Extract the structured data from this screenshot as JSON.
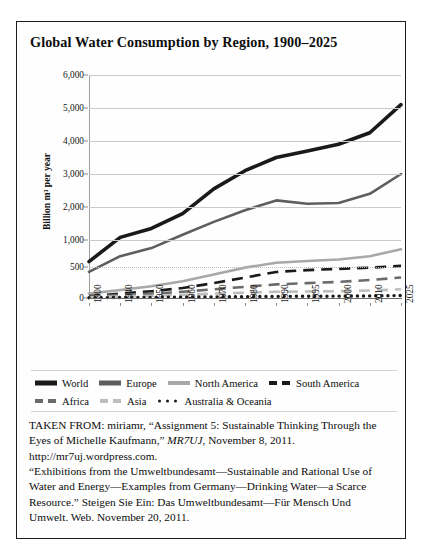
{
  "figure": {
    "title": "Global Water Consumption by Region, 1900–2025"
  },
  "caption": {
    "line1_a": "TAKEN FROM: miriamr, “Assignment 5: Sustainable Thinking Through the Eyes of Michelle Kaufmann,” ",
    "line1_italic": "MR7UJ",
    "line1_b": ", November 8, 2011. http://mr7uj.wordpress.com.",
    "line2": "“Exhibitions from the Umweltbundesamt—Sustainable and Rational Use of Water and Energy—Examples from Germany—Drinking Water—a Scarce Resource.” Steigen Sie Ein: Das Umweltbundesamt—Für Mensch Und Umwelt. Web. November 20, 2011."
  },
  "colors": {
    "world": "#1a1a1a",
    "europe": "#5e5e5e",
    "north_america": "#a8a8a8",
    "south_america": "#1a1a1a",
    "africa": "#6b6b6b",
    "asia": "#bdbdbd",
    "australia_oceania": "#1a1a1a",
    "gridline": "#c9c9c9",
    "frame": "#1b1b1b"
  },
  "chart_data": {
    "type": "line",
    "title": "Global Water Consumption by Region, 1900–2025",
    "xlabel": "",
    "ylabel": "Billion m³ per year",
    "grid": true,
    "legend_position": "bottom",
    "categories": [
      "1900",
      "1940",
      "1950",
      "1960",
      "1970",
      "1980",
      "1990",
      "1995",
      "2000",
      "2010",
      "2025"
    ],
    "ytick_labels": [
      "6,000",
      "5,000",
      "4,000",
      "3,000",
      "2,000",
      "1,000",
      "500",
      "0"
    ],
    "ytick_values": [
      6000,
      5000,
      4000,
      3000,
      2000,
      1000,
      500,
      0
    ],
    "ylim": [
      0,
      6000
    ],
    "series": [
      {
        "name": "World",
        "style": "solid",
        "width": "thick",
        "color": "#1a1a1a",
        "values": [
          600,
          1080,
          1350,
          1800,
          2550,
          3100,
          3500,
          3700,
          3900,
          4250,
          5100
        ]
      },
      {
        "name": "Europe",
        "style": "solid",
        "width": "medium",
        "color": "#5e5e5e",
        "values": [
          420,
          700,
          850,
          1160,
          1550,
          1900,
          2200,
          2100,
          2120,
          2400,
          3000
        ]
      },
      {
        "name": "North America",
        "style": "solid",
        "width": "medium",
        "color": "#a8a8a8",
        "values": [
          70,
          130,
          190,
          270,
          380,
          490,
          580,
          610,
          640,
          700,
          830
        ]
      },
      {
        "name": "South America",
        "style": "dashed",
        "width": "medium",
        "color": "#1a1a1a",
        "values": [
          30,
          70,
          110,
          160,
          240,
          330,
          420,
          450,
          470,
          490,
          520
        ]
      },
      {
        "name": "Africa",
        "style": "dashed",
        "width": "medium",
        "color": "#6b6b6b",
        "values": [
          20,
          50,
          70,
          100,
          140,
          180,
          220,
          240,
          260,
          290,
          330
        ]
      },
      {
        "name": "Asia",
        "style": "dashed",
        "width": "medium",
        "color": "#bdbdbd",
        "values": [
          10,
          25,
          35,
          50,
          70,
          85,
          100,
          105,
          110,
          120,
          140
        ]
      },
      {
        "name": "Australia & Oceania",
        "style": "dotted",
        "width": "thin",
        "color": "#1a1a1a",
        "values": [
          5,
          8,
          10,
          14,
          18,
          22,
          26,
          28,
          30,
          34,
          40
        ]
      }
    ]
  },
  "legend": {
    "rows": [
      [
        {
          "label": "World",
          "key": "world",
          "style": "solid",
          "thickness": 5
        },
        {
          "label": "Europe",
          "key": "europe",
          "style": "solid",
          "thickness": 5
        },
        {
          "label": "North America",
          "key": "north_america",
          "style": "solid",
          "thickness": 4
        },
        {
          "label": "South America",
          "key": "south_america",
          "style": "dashed",
          "thickness": 4
        }
      ],
      [
        {
          "label": "Africa",
          "key": "africa",
          "style": "dashed",
          "thickness": 4
        },
        {
          "label": "Asia",
          "key": "asia",
          "style": "dashed",
          "thickness": 4
        },
        {
          "label": "Australia & Oceania",
          "key": "australia_oceania",
          "style": "dotted",
          "thickness": 3
        }
      ]
    ]
  }
}
